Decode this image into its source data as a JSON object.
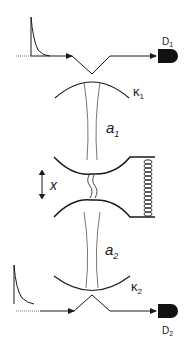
{
  "diagram": {
    "colors": {
      "line": "#1a1a1a",
      "mode": "#555555",
      "detector": "#111111",
      "background": "#ffffff"
    },
    "labels": {
      "detector_top": "D",
      "detector_top_sub": "1",
      "detector_bottom": "D",
      "detector_bottom_sub": "2",
      "kappa_top": "κ",
      "kappa_top_sub": "1",
      "kappa_bottom": "κ",
      "kappa_bottom_sub": "2",
      "mode_top": "a",
      "mode_top_sub": "1",
      "mode_bottom": "a",
      "mode_bottom_sub": "2",
      "displacement": "x"
    },
    "components": [
      {
        "id": "input-pulse-top",
        "type": "decaying-pulse"
      },
      {
        "id": "input-beam-top",
        "type": "reflected-beam-path"
      },
      {
        "id": "detector-top",
        "type": "photodetector"
      },
      {
        "id": "mirror-top",
        "type": "concave-mirror"
      },
      {
        "id": "cavity-mode-top",
        "type": "gaussian-beam-waist"
      },
      {
        "id": "mechanical-oscillator",
        "type": "double-sided-mirror"
      },
      {
        "id": "spring",
        "type": "coil-spring"
      },
      {
        "id": "displacement-arrow",
        "type": "double-arrow"
      },
      {
        "id": "cavity-mode-bottom",
        "type": "gaussian-beam-waist"
      },
      {
        "id": "mirror-bottom",
        "type": "concave-mirror"
      },
      {
        "id": "input-pulse-bottom",
        "type": "decaying-pulse"
      },
      {
        "id": "input-beam-bottom",
        "type": "reflected-beam-path"
      },
      {
        "id": "detector-bottom",
        "type": "photodetector"
      }
    ]
  }
}
